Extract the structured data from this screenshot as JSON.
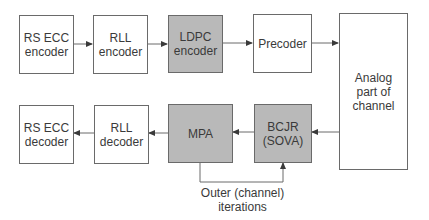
{
  "diagram": {
    "colors": {
      "shaded": "#b9b9b9",
      "plain": "#ffffff",
      "line": "#6a6a6a"
    },
    "blocks": {
      "rs_ecc_encoder": {
        "label": "RS ECC\nencoder",
        "shaded": false
      },
      "rll_encoder": {
        "label": "RLL\nencoder",
        "shaded": false
      },
      "ldpc_encoder": {
        "label": "LDPC\nencoder",
        "shaded": true
      },
      "precoder": {
        "label": "Precoder",
        "shaded": false
      },
      "analog_channel": {
        "label": "Analog\npart of\nchannel",
        "shaded": false
      },
      "rs_ecc_decoder": {
        "label": "RS ECC\ndecoder",
        "shaded": false
      },
      "rll_decoder": {
        "label": "RLL\ndecoder",
        "shaded": false
      },
      "mpa": {
        "label": "MPA",
        "shaded": true
      },
      "bcjr": {
        "label": "BCJR\n(SOVA)",
        "shaded": true
      }
    },
    "feedback_label": "Outer (channel)\niterations",
    "edges": [
      [
        "rs_ecc_encoder",
        "rll_encoder"
      ],
      [
        "rll_encoder",
        "ldpc_encoder"
      ],
      [
        "ldpc_encoder",
        "precoder"
      ],
      [
        "precoder",
        "analog_channel"
      ],
      [
        "analog_channel",
        "bcjr"
      ],
      [
        "bcjr",
        "mpa"
      ],
      [
        "mpa",
        "rll_decoder"
      ],
      [
        "rll_decoder",
        "rs_ecc_decoder"
      ],
      [
        "mpa",
        "bcjr"
      ]
    ]
  }
}
